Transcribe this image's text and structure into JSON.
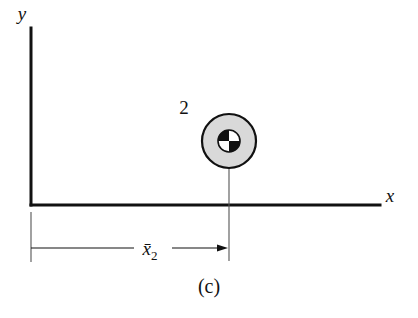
{
  "figure": {
    "caption": "(c)",
    "background_color": "#ffffff",
    "ink_color": "#111111",
    "width": 418,
    "height": 318
  },
  "axes": {
    "y_axis": {
      "label": "y",
      "x": 31,
      "y_top": 28,
      "y_bottom": 205,
      "label_x": 22,
      "label_y": 20
    },
    "x_axis": {
      "label": "x",
      "y": 205,
      "x_left": 31,
      "x_right": 380,
      "label_x": 390,
      "label_y": 202
    },
    "origin": {
      "x": 31,
      "y": 205
    }
  },
  "body": {
    "number_label": "2",
    "number_label_x": 184,
    "number_label_y": 114,
    "center_x": 229,
    "center_y": 141,
    "outer_radius": 27,
    "inner_radius": 11,
    "outer_fill": "#d9d9d9",
    "inner_fill": "#ffffff",
    "quadrant_fill": "#111111",
    "stroke": "#111111",
    "outer_stroke_width": 2.2,
    "inner_stroke_width": 1.6,
    "quadrants": [
      {
        "name": "top-left",
        "shade": "black"
      },
      {
        "name": "top-right",
        "shade": "white"
      },
      {
        "name": "bottom-left",
        "shade": "white"
      },
      {
        "name": "bottom-right",
        "shade": "black"
      }
    ]
  },
  "leader_line": {
    "x": 229,
    "y_top": 168,
    "y_bottom": 261,
    "stroke_width": 1.1
  },
  "dimension": {
    "label_main": "x̄",
    "label_sub": "2",
    "label_full": "x̄2",
    "line_y": 248,
    "x_start": 31,
    "x_end": 228,
    "label_x": 150,
    "label_y": 255,
    "gap_left": 134,
    "gap_right": 172,
    "left_extension": {
      "x": 31,
      "y_top": 212,
      "y_bottom": 262
    },
    "arrow_direction": "right",
    "stroke_width": 1.1
  },
  "caption_position": {
    "x": 209,
    "y": 293
  }
}
